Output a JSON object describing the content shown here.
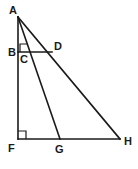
{
  "figure": {
    "type": "geometry-diagram",
    "background_color": "#ffffff",
    "stroke_color": "#1a1a1a",
    "canvas": {
      "width": 138,
      "height": 169
    },
    "points": [
      {
        "name": "A",
        "label": "A",
        "x": 18,
        "y": 17,
        "label_x": 9,
        "label_y": 5,
        "description": "apex vertex, top of vertical leg"
      },
      {
        "name": "B",
        "label": "B",
        "x": 18,
        "y": 52,
        "label_x": 8,
        "label_y": 47,
        "description": "point on segment AF, left end of horizontal BD"
      },
      {
        "name": "C",
        "label": "C",
        "x": 25,
        "y": 56,
        "label_x": 20,
        "label_y": 54,
        "description": "point just below B on segment AG"
      },
      {
        "name": "D",
        "label": "D",
        "x": 52,
        "y": 52,
        "label_x": 54,
        "label_y": 41,
        "description": "right end of horizontal BD, lies on segment AH"
      },
      {
        "name": "F",
        "label": "F",
        "x": 18,
        "y": 139,
        "label_x": 8,
        "label_y": 143,
        "description": "bottom-left right-angle vertex"
      },
      {
        "name": "G",
        "label": "G",
        "x": 60,
        "y": 139,
        "label_x": 55,
        "label_y": 144,
        "description": "point on base FH, foot of cevian AG"
      },
      {
        "name": "H",
        "label": "H",
        "x": 120,
        "y": 139,
        "label_x": 124,
        "label_y": 136,
        "description": "bottom-right vertex"
      }
    ],
    "segments": [
      {
        "name": "AF",
        "from": "A",
        "to": "F",
        "x1": 18,
        "y1": 17,
        "x2": 18,
        "y2": 139,
        "width": 1.6
      },
      {
        "name": "FH",
        "from": "F",
        "to": "H",
        "x1": 18,
        "y1": 139,
        "x2": 120,
        "y2": 139,
        "width": 1.6
      },
      {
        "name": "AH",
        "from": "A",
        "to": "H",
        "x1": 18,
        "y1": 17,
        "x2": 120,
        "y2": 139,
        "width": 1.6
      },
      {
        "name": "AG",
        "from": "A",
        "to": "G",
        "x1": 18,
        "y1": 17,
        "x2": 60,
        "y2": 139,
        "width": 1.6
      },
      {
        "name": "BD",
        "from": "B",
        "to": "D",
        "x1": 18,
        "y1": 52,
        "x2": 52,
        "y2": 52,
        "width": 1.6
      }
    ],
    "right_angles": [
      {
        "name": "right-angle-B",
        "at": "B",
        "path": "M 20 52 L 20 44 L 27 44",
        "description": "right angle between AB and BD"
      },
      {
        "name": "right-angle-F",
        "at": "F",
        "path": "M 18 131 L 26 131 L 26 139",
        "description": "right angle between AF and FH"
      }
    ]
  }
}
